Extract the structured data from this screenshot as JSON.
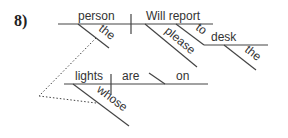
{
  "problem_number": "8)",
  "diagram": {
    "main_clause": {
      "subject": "person",
      "verb": "Will report",
      "subject_modifier": "the",
      "verb_modifier": "please",
      "preposition": "to",
      "prep_object": "desk",
      "prep_object_modifier": "the"
    },
    "relative_clause": {
      "subject": "lights",
      "verb": "are",
      "complement": "on",
      "subject_modifier": "whose"
    }
  },
  "colors": {
    "line": "#444444",
    "text": "#333333"
  }
}
